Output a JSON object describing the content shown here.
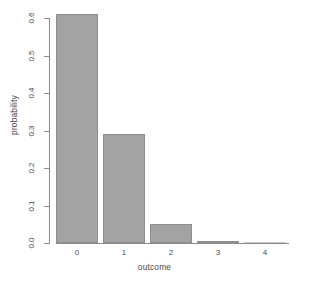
{
  "chart_data": {
    "type": "bar",
    "title": "",
    "subtitle": "",
    "xlabel": "outcome",
    "ylabel": "probability",
    "categories": [
      "0",
      "1",
      "2",
      "3",
      "4"
    ],
    "values": [
      0.61,
      0.29,
      0.05,
      0.005,
      0.0005
    ],
    "series": [
      {
        "name": "probability",
        "values": [
          0.61,
          0.29,
          0.05,
          0.005,
          0.0005
        ]
      }
    ],
    "ylim": [
      0.0,
      0.65
    ],
    "xlim_note": "categorical",
    "ytick_labels": [
      "0.0",
      "0.1",
      "0.2",
      "0.3",
      "0.4",
      "0.5",
      "0.6"
    ],
    "ytick_values": [
      0.0,
      0.1,
      0.2,
      0.3,
      0.4,
      0.5,
      0.6
    ],
    "xtick_labels": [
      "0",
      "1",
      "2",
      "3",
      "4"
    ],
    "grid": false,
    "legend": false,
    "legend_position": "none",
    "bar_fill_color": "#a3a3a3",
    "bar_border_color": "#8f8f8f",
    "axis_color": "#8c8c8c",
    "text_color": "#4a4a4a",
    "background_color": "#ffffff",
    "annotations": []
  },
  "plot": {
    "ylabel": "probability",
    "xlabel": "outcome"
  }
}
